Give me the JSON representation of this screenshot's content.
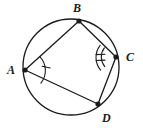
{
  "figure": {
    "type": "geometry-diagram",
    "background_color": "#ffffff",
    "stroke_color": "#1a1a1a",
    "label_color": "#1a1a1a",
    "circle": {
      "center_x": 71,
      "center_y": 67,
      "radius": 48,
      "stroke_width": 1.3
    },
    "vertices": [
      {
        "id": "A",
        "label": "A",
        "x": 25,
        "y": 70,
        "label_x": 7,
        "label_y": 64,
        "dot_radius": 2.6
      },
      {
        "id": "B",
        "label": "B",
        "x": 79,
        "y": 21,
        "label_x": 73,
        "label_y": 2,
        "dot_radius": 2.6
      },
      {
        "id": "C",
        "label": "C",
        "x": 116,
        "y": 57,
        "label_x": 126,
        "label_y": 51,
        "dot_radius": 2.6
      },
      {
        "id": "D",
        "label": "D",
        "x": 98,
        "y": 104,
        "label_x": 102,
        "label_y": 112,
        "dot_radius": 2.6
      }
    ],
    "chords": [
      {
        "id": "AB",
        "from": "A",
        "to": "B"
      },
      {
        "id": "BC",
        "from": "B",
        "to": "C"
      },
      {
        "id": "CD",
        "from": "C",
        "to": "D"
      },
      {
        "id": "DA",
        "from": "D",
        "to": "A"
      }
    ],
    "angle_marks": [
      {
        "id": "angle-A",
        "vertex": "A",
        "arc_count": 1,
        "tick_count": 1,
        "note": "single arc with one tick mark"
      },
      {
        "id": "angle-C",
        "vertex": "C",
        "arc_count": 2,
        "tick_count": 2,
        "note": "double arc with tick marks"
      }
    ]
  }
}
